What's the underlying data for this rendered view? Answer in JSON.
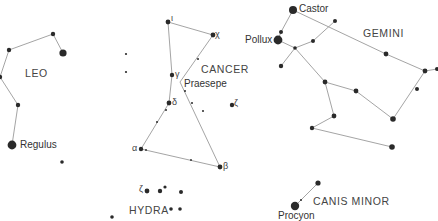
{
  "colors": {
    "line": "#9a9a9a",
    "star": "#2a2a2a",
    "label": "#3a3a3a",
    "background": "#ffffff"
  },
  "constellations": [
    {
      "name": "LEO",
      "label_pos": [
        25,
        68
      ]
    },
    {
      "name": "CANCER",
      "label_pos": [
        201,
        64
      ]
    },
    {
      "name": "GEMINI",
      "label_pos": [
        363,
        28
      ]
    },
    {
      "name": "HYDRA",
      "label_pos": [
        129,
        205
      ]
    },
    {
      "name": "CANIS MINOR",
      "label_pos": [
        313,
        196
      ]
    }
  ],
  "named_stars": [
    {
      "name": "Regulus",
      "pos": [
        22,
        140
      ]
    },
    {
      "name": "Praesepe",
      "pos": [
        184,
        79
      ]
    },
    {
      "name": "Castor",
      "pos": [
        299,
        4
      ]
    },
    {
      "name": "Pollux",
      "pos": [
        245,
        35
      ]
    },
    {
      "name": "Procyon",
      "pos": [
        278,
        212
      ]
    }
  ],
  "greek_labels": [
    {
      "letter": "ι",
      "pos": [
        171,
        14
      ]
    },
    {
      "letter": "χ",
      "pos": [
        215,
        30
      ]
    },
    {
      "letter": "γ",
      "pos": [
        175,
        69
      ]
    },
    {
      "letter": "δ",
      "pos": [
        172,
        98
      ]
    },
    {
      "letter": "ζ",
      "pos": [
        234,
        99
      ]
    },
    {
      "letter": "α",
      "pos": [
        133,
        144
      ]
    },
    {
      "letter": "β",
      "pos": [
        222,
        162
      ]
    },
    {
      "letter": "ζ",
      "pos": [
        140,
        183
      ]
    }
  ],
  "stars": [
    {
      "x": 53,
      "y": 34,
      "r": 2.2
    },
    {
      "x": 63,
      "y": 53,
      "r": 3.6
    },
    {
      "x": 9,
      "y": 50,
      "r": 2.2
    },
    {
      "x": 0,
      "y": 77,
      "r": 2.2
    },
    {
      "x": 18,
      "y": 105,
      "r": 2.2
    },
    {
      "x": 12,
      "y": 145,
      "r": 4.4
    },
    {
      "x": 62,
      "y": 162,
      "r": 1.8
    },
    {
      "x": 126,
      "y": 54,
      "r": 1.1
    },
    {
      "x": 126,
      "y": 72,
      "r": 1.1
    },
    {
      "x": 168,
      "y": 22,
      "r": 2.4
    },
    {
      "x": 213,
      "y": 35,
      "r": 2.4
    },
    {
      "x": 172,
      "y": 75,
      "r": 2.2
    },
    {
      "x": 169,
      "y": 103,
      "r": 2.4
    },
    {
      "x": 141,
      "y": 149,
      "r": 2.2
    },
    {
      "x": 220,
      "y": 167,
      "r": 2.4
    },
    {
      "x": 232,
      "y": 105,
      "r": 2.2
    },
    {
      "x": 198,
      "y": 59,
      "r": 1.0
    },
    {
      "x": 185,
      "y": 91,
      "r": 1.0
    },
    {
      "x": 192,
      "y": 103,
      "r": 1.0
    },
    {
      "x": 157,
      "y": 122,
      "r": 1.0
    },
    {
      "x": 146,
      "y": 150,
      "r": 0.9
    },
    {
      "x": 191,
      "y": 160,
      "r": 0.9
    },
    {
      "x": 203,
      "y": 111,
      "r": 1.0
    },
    {
      "x": 166,
      "y": 110,
      "r": 1.0
    },
    {
      "x": 147,
      "y": 191,
      "r": 2.4
    },
    {
      "x": 160,
      "y": 191,
      "r": 2.2
    },
    {
      "x": 165,
      "y": 187,
      "r": 1.6
    },
    {
      "x": 181,
      "y": 192,
      "r": 2.0
    },
    {
      "x": 171,
      "y": 209,
      "r": 1.8
    },
    {
      "x": 180,
      "y": 209,
      "r": 1.8
    },
    {
      "x": 112,
      "y": 217,
      "r": 1.8
    },
    {
      "x": 293,
      "y": 10,
      "r": 4.0
    },
    {
      "x": 278,
      "y": 40,
      "r": 4.4
    },
    {
      "x": 281,
      "y": 32,
      "r": 2.0
    },
    {
      "x": 335,
      "y": 21,
      "r": 2.0
    },
    {
      "x": 313,
      "y": 41,
      "r": 2.0
    },
    {
      "x": 295,
      "y": 48,
      "r": 1.8
    },
    {
      "x": 281,
      "y": 66,
      "r": 2.2
    },
    {
      "x": 325,
      "y": 82,
      "r": 2.4
    },
    {
      "x": 356,
      "y": 91,
      "r": 2.4
    },
    {
      "x": 386,
      "y": 54,
      "r": 2.4
    },
    {
      "x": 425,
      "y": 71,
      "r": 2.4
    },
    {
      "x": 437,
      "y": 69,
      "r": 2.0
    },
    {
      "x": 417,
      "y": 89,
      "r": 2.0
    },
    {
      "x": 334,
      "y": 116,
      "r": 2.4
    },
    {
      "x": 393,
      "y": 119,
      "r": 2.8
    },
    {
      "x": 312,
      "y": 128,
      "r": 2.2
    },
    {
      "x": 392,
      "y": 147,
      "r": 2.8
    },
    {
      "x": 318,
      "y": 183,
      "r": 2.6
    },
    {
      "x": 295,
      "y": 206,
      "r": 4.2
    },
    {
      "x": 301,
      "y": 200,
      "r": 1.0
    }
  ],
  "lines": [
    [
      [
        9,
        50
      ],
      [
        53,
        34
      ],
      [
        63,
        53
      ]
    ],
    [
      [
        9,
        50
      ],
      [
        0,
        77
      ],
      [
        18,
        105
      ],
      [
        12,
        145
      ]
    ],
    [
      [
        213,
        35
      ],
      [
        168,
        22
      ],
      [
        172,
        75
      ],
      [
        169,
        103
      ],
      [
        141,
        149
      ],
      [
        220,
        167
      ]
    ],
    [
      [
        213,
        35
      ],
      [
        180,
        82
      ],
      [
        220,
        167
      ]
    ],
    [
      [
        293,
        10
      ],
      [
        386,
        54
      ],
      [
        425,
        71
      ],
      [
        437,
        69
      ]
    ],
    [
      [
        293,
        10
      ],
      [
        281,
        32
      ],
      [
        278,
        40
      ],
      [
        295,
        48
      ],
      [
        313,
        41
      ],
      [
        335,
        21
      ]
    ],
    [
      [
        295,
        48
      ],
      [
        281,
        66
      ]
    ],
    [
      [
        295,
        48
      ],
      [
        325,
        82
      ],
      [
        356,
        91
      ],
      [
        393,
        119
      ],
      [
        425,
        71
      ]
    ],
    [
      [
        325,
        82
      ],
      [
        334,
        116
      ],
      [
        312,
        128
      ]
    ],
    [
      [
        312,
        128
      ],
      [
        392,
        147
      ]
    ],
    [
      [
        295,
        206
      ],
      [
        318,
        183
      ]
    ]
  ]
}
